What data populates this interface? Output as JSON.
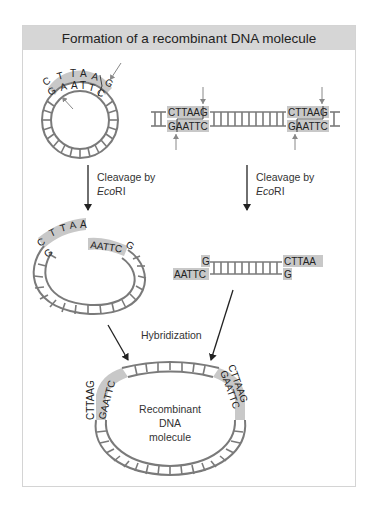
{
  "title": "Formation of a recombinant DNA molecule",
  "plasmid": {
    "top_strand": "CTTAAG",
    "bottom_strand": "GAATTC"
  },
  "linear_dna": {
    "site1_top": "CTTAAG",
    "site1_bottom": "GAATTC",
    "site2_top": "CTTAAG",
    "site2_bottom": "GAATTC"
  },
  "step1_left": {
    "line1": "Cleavage by",
    "italic": "Eco",
    "rest": "RI"
  },
  "step1_right": {
    "line1": "Cleavage by",
    "italic": "Eco",
    "rest": "RI"
  },
  "cut_plasmid": {
    "left_end_top": "CTTAA",
    "left_end_bottom": "G",
    "right_end_top": "AATTC",
    "right_end_bottom": "G"
  },
  "fragment": {
    "left_top": "G",
    "left_bottom": "AATTC",
    "right_top": "CTTAA",
    "right_bottom": "G"
  },
  "step2": {
    "label": "Hybridization"
  },
  "recombinant": {
    "label_line1": "Recombinant",
    "label_line2": "DNA",
    "label_line3": "molecule",
    "left_outer": "CTTAAG",
    "left_inner": "GAATTC",
    "right_outer": "CTTAAG",
    "right_inner": "GAATTC"
  },
  "colors": {
    "title_bar": "#d6d6d6",
    "sticky_highlight": "#c8c8c8",
    "dna_ladder": "#7a7a7a",
    "arrow": "#222222",
    "cut_arrow": "#888888"
  }
}
